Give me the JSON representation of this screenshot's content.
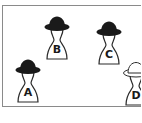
{
  "diagram": {
    "colors": {
      "frame": "#8a8a8a",
      "hat_black": "#1a1a1a",
      "hat_white": "#ffffff",
      "outline": "#2a2a2a",
      "background": "#ffffff"
    },
    "figures": [
      {
        "label": "A",
        "hat": "black"
      },
      {
        "label": "B",
        "hat": "black"
      },
      {
        "label": "C",
        "hat": "black"
      },
      {
        "label": "D",
        "hat": "white"
      }
    ]
  }
}
